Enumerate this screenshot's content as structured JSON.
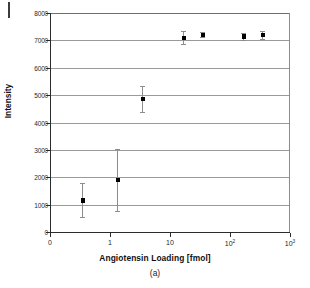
{
  "figure": {
    "caption": "(a)",
    "artifact_name": "scan-edge-artifact"
  },
  "chart_data": {
    "type": "scatter",
    "title": "",
    "xlabel": "Angiotensin Loading [fmol]",
    "ylabel": "Intensity",
    "xscale": "log",
    "yscale": "linear",
    "ylim": [
      0,
      8000
    ],
    "xlim": [
      0.2,
      1000
    ],
    "grid": true,
    "legend": null,
    "yticks": [
      0,
      1000,
      2000,
      3000,
      4000,
      5000,
      6000,
      7000,
      8000
    ],
    "ytick_labels": [
      "0",
      "1000",
      "2000",
      "3000",
      "4000",
      "5000",
      "6000",
      "7000",
      "8000"
    ],
    "xtick_labels": [
      "0",
      "1",
      "10",
      "10²",
      "10³"
    ],
    "xtick_bases": [
      "0",
      "1",
      "10",
      "10",
      "10"
    ],
    "xtick_exponents": [
      "",
      "",
      "",
      "2",
      "3"
    ],
    "series": [
      {
        "name": "Angiotensin signal",
        "marker": "filled-square",
        "color": "#000000",
        "errorbar_color": "#8d8d8d",
        "points": [
          {
            "x": 0.35,
            "y": 1150,
            "yerr_low": 530,
            "yerr_high": 1780
          },
          {
            "x": 1.35,
            "y": 1900,
            "yerr_low": 780,
            "yerr_high": 3020
          },
          {
            "x": 3.5,
            "y": 4850,
            "yerr_low": 4400,
            "yerr_high": 5350
          },
          {
            "x": 17,
            "y": 7100,
            "yerr_low": 6880,
            "yerr_high": 7330
          },
          {
            "x": 35,
            "y": 7200,
            "yerr_low": 7110,
            "yerr_high": 7290
          },
          {
            "x": 170,
            "y": 7140,
            "yerr_low": 7020,
            "yerr_high": 7270
          },
          {
            "x": 350,
            "y": 7200,
            "yerr_low": 7050,
            "yerr_high": 7350
          }
        ]
      }
    ]
  }
}
